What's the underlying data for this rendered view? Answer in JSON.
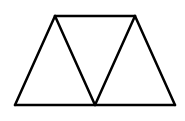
{
  "diagram": {
    "type": "geometric-figure",
    "canvas": {
      "width": 185,
      "height": 121,
      "background": "#ffffff"
    },
    "stroke": {
      "color": "#000000",
      "width": 2.5
    },
    "vertices": {
      "top_left": [
        55,
        16
      ],
      "top_right": [
        135,
        16
      ],
      "bottom_left": [
        15,
        105
      ],
      "bottom_middle": [
        95,
        105
      ],
      "bottom_right": [
        175,
        105
      ]
    },
    "segments": [
      {
        "name": "top-edge",
        "from": "top_left",
        "to": "top_right"
      },
      {
        "name": "bottom-edge",
        "from": "bottom_left",
        "to": "bottom_right"
      },
      {
        "name": "left-edge",
        "from": "bottom_left",
        "to": "top_left"
      },
      {
        "name": "right-edge",
        "from": "top_right",
        "to": "bottom_right"
      },
      {
        "name": "inner-left-diagonal",
        "from": "top_left",
        "to": "bottom_middle"
      },
      {
        "name": "inner-right-diagonal",
        "from": "top_right",
        "to": "bottom_middle"
      }
    ],
    "triangles": [
      {
        "name": "left-triangle",
        "points": [
          "bottom_left",
          "top_left",
          "bottom_middle"
        ]
      },
      {
        "name": "middle-triangle",
        "points": [
          "top_left",
          "top_right",
          "bottom_middle"
        ]
      },
      {
        "name": "right-triangle",
        "points": [
          "bottom_middle",
          "top_right",
          "bottom_right"
        ]
      }
    ]
  }
}
